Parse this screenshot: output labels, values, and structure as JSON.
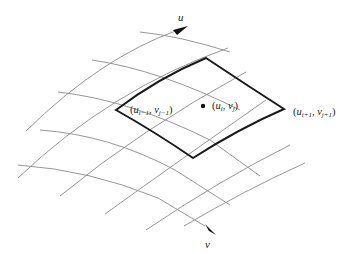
{
  "diagram": {
    "axes": {
      "u_label": "u",
      "v_label": "v"
    },
    "points": {
      "center": {
        "label_u": "u",
        "label_u_sub": "i",
        "label_v": "v",
        "label_v_sub": "j"
      },
      "prev": {
        "label_u": "u",
        "label_u_sub": "i−1",
        "label_v": "v",
        "label_v_sub": "j−1"
      },
      "next": {
        "label_u": "u",
        "label_u_sub": "i+1",
        "label_v": "v",
        "label_v_sub": "j+1"
      }
    },
    "punctuation": {
      "open": "(",
      "comma": ", ",
      "close": ")"
    },
    "colors": {
      "grid": "#8a8a8a",
      "highlight": "#1a1a1a",
      "background": "#ffffff"
    }
  }
}
